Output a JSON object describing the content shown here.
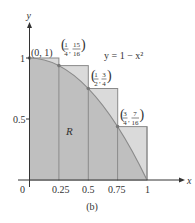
{
  "figure": {
    "caption": "(b)",
    "equation": "y = 1 − x²",
    "region_label": "R",
    "axes": {
      "x_label": "x",
      "y_label": "y",
      "x_ticks": [
        "0",
        "0.25",
        "0.5",
        "0.75",
        "1"
      ],
      "y_ticks": [
        "0.5",
        "1"
      ]
    },
    "points": [
      {
        "x": 0,
        "y": 1,
        "label": "(0, 1)"
      },
      {
        "x": 0.25,
        "y": 0.9375,
        "label_num_x": "1",
        "label_den_x": "4",
        "label_num_y": "15",
        "label_den_y": "16"
      },
      {
        "x": 0.5,
        "y": 0.75,
        "label_num_x": "1",
        "label_den_x": "2",
        "label_num_y": "3",
        "label_den_y": "4"
      },
      {
        "x": 0.75,
        "y": 0.4375,
        "label_num_x": "3",
        "label_den_x": "4",
        "label_num_y": "7",
        "label_den_y": "16"
      }
    ],
    "rectangles": [
      {
        "x0": 0,
        "x1": 0.25,
        "height": 1
      },
      {
        "x0": 0.25,
        "x1": 0.5,
        "height": 0.9375
      },
      {
        "x0": 0.5,
        "x1": 0.75,
        "height": 0.75
      },
      {
        "x0": 0.75,
        "x1": 1,
        "height": 0.4375
      }
    ],
    "colors": {
      "rect_fill": "#dadada",
      "region_fill": "#bfbfbf",
      "outline": "#8a8a8a",
      "axis": "#333333"
    }
  }
}
